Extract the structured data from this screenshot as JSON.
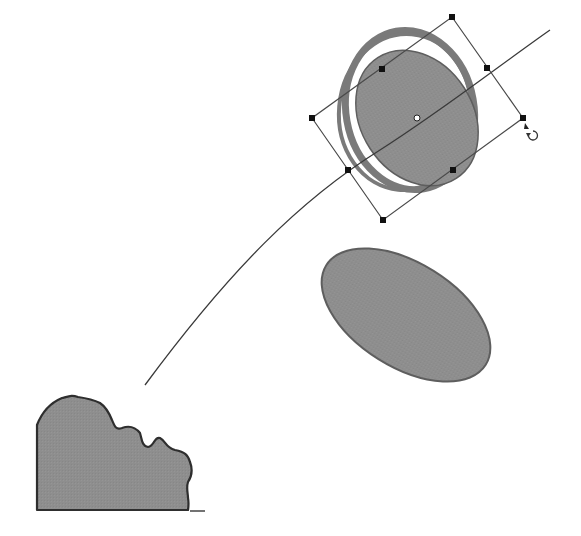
{
  "canvas": {
    "width": 581,
    "height": 536,
    "background": "#ffffff"
  },
  "colors": {
    "shape_fill": "#8e8e8e",
    "shape_stroke": "#5e5e5e",
    "ghost_stroke": "#7a7a7a",
    "path_stroke": "#3a3a3a",
    "bbox_stroke": "#4a4a4a",
    "handle_fill": "#111111",
    "center_fill": "#ffffff"
  },
  "objects": {
    "selected_ellipse": {
      "cx": 417,
      "cy": 118,
      "rx": 72,
      "ry": 56,
      "rotation": 57
    },
    "ghost_ellipses": [
      {
        "cx": 410,
        "cy": 110,
        "rx": 80,
        "ry": 64,
        "rotation": 80
      },
      {
        "cx": 405,
        "cy": 112,
        "rx": 78,
        "ry": 66,
        "rotation": 95
      }
    ],
    "second_ellipse": {
      "cx": 406,
      "cy": 315,
      "rx": 94,
      "ry": 52,
      "rotation": 32
    },
    "motion_path": {
      "d": "M 145 385 C 230 270, 300 200, 380 150 C 440 112, 500 65, 550 30"
    },
    "blob_shape": {
      "d": "M 37 425 C 42 412, 50 403, 62 398 C 70 396, 72 395, 78 397 C 85 398, 92 399, 100 403 C 106 407, 110 415, 112 420 C 115 427, 116 430, 122 428 C 130 425, 136 428, 140 433 C 142 440, 142 446, 148 447 C 155 446, 154 436, 160 438 C 166 441, 165 447, 175 450 C 185 452, 188 455, 190 462 C 193 470, 192 476, 188 482 C 186 488, 188 493, 188 498 C 189 503, 188 510, 188 510 L 37 510 Z"
    }
  },
  "selection": {
    "bbox_corners": [
      [
        452,
        17
      ],
      [
        523,
        118
      ],
      [
        383,
        220
      ],
      [
        312,
        118
      ]
    ],
    "handles": [
      {
        "name": "handle-top-corner",
        "x": 452,
        "y": 17
      },
      {
        "name": "handle-top-mid",
        "x": 382,
        "y": 69
      },
      {
        "name": "handle-right-mid",
        "x": 487,
        "y": 68
      },
      {
        "name": "handle-right-corner",
        "x": 523,
        "y": 118
      },
      {
        "name": "handle-left-corner",
        "x": 312,
        "y": 118
      },
      {
        "name": "handle-left-mid",
        "x": 348,
        "y": 170
      },
      {
        "name": "handle-bottom-mid",
        "x": 453,
        "y": 170
      },
      {
        "name": "handle-bottom-corner",
        "x": 383,
        "y": 220
      }
    ],
    "center": {
      "x": 417,
      "y": 118
    },
    "rotate_cursor": {
      "x": 532,
      "y": 133,
      "glyph": "↻"
    }
  }
}
